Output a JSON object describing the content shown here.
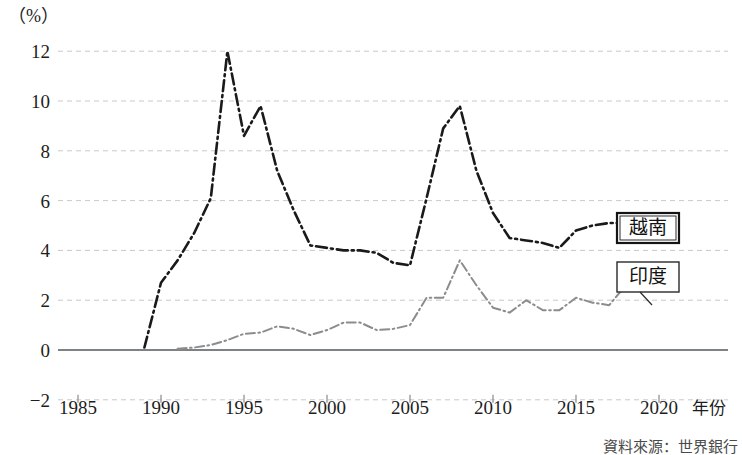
{
  "chart_data": {
    "type": "line",
    "title": "",
    "unit_label": "（%）",
    "xlabel": "年份",
    "ylabel": "",
    "xlim": [
      1983,
      2021
    ],
    "ylim": [
      -2,
      13
    ],
    "grid": true,
    "x_ticks": [
      "1985",
      "1990",
      "1995",
      "2000",
      "2005",
      "2010",
      "2015",
      "2020"
    ],
    "x_tick_values": [
      1985,
      1990,
      1995,
      2000,
      2005,
      2010,
      2015,
      2020
    ],
    "y_ticks": [
      "12",
      "10",
      "8",
      "6",
      "4",
      "2",
      "0",
      "-2"
    ],
    "y_tick_values": [
      12,
      10,
      8,
      6,
      4,
      2,
      0,
      -2
    ],
    "legend_position": "right-inside",
    "series": [
      {
        "name": "越南",
        "color": "#1a1a1a",
        "style": "dash-dot",
        "width": 2.6,
        "x": [
          1989,
          1990,
          1991,
          1992,
          1993,
          1994,
          1995,
          1996,
          1997,
          1998,
          1999,
          2000,
          2001,
          2002,
          2003,
          2004,
          2005,
          2006,
          2007,
          2008,
          2009,
          2010,
          2011,
          2012,
          2013,
          2014,
          2015,
          2016,
          2017,
          2018
        ],
        "values": [
          0.1,
          2.7,
          3.6,
          4.7,
          6.1,
          12.0,
          8.6,
          9.8,
          7.2,
          5.6,
          4.2,
          4.1,
          4.0,
          4.0,
          3.9,
          3.5,
          3.4,
          6.1,
          8.9,
          9.8,
          7.2,
          5.5,
          4.5,
          4.4,
          4.3,
          4.1,
          4.8,
          5.0,
          5.1,
          5.1
        ]
      },
      {
        "name": "印度",
        "color": "#8c8c8c",
        "style": "dash-dot",
        "width": 2.0,
        "x": [
          1991,
          1992,
          1993,
          1994,
          1995,
          1996,
          1997,
          1998,
          1999,
          2000,
          2001,
          2002,
          2003,
          2004,
          2005,
          2006,
          2007,
          2008,
          2009,
          2010,
          2011,
          2012,
          2013,
          2014,
          2015,
          2016,
          2017,
          2018
        ],
        "values": [
          0.05,
          0.1,
          0.2,
          0.4,
          0.65,
          0.7,
          0.95,
          0.85,
          0.6,
          0.8,
          1.1,
          1.1,
          0.8,
          0.85,
          1.0,
          2.1,
          2.1,
          3.6,
          2.6,
          1.7,
          1.5,
          2.0,
          1.6,
          1.6,
          2.1,
          1.9,
          1.8,
          2.6
        ]
      }
    ],
    "annotations": [
      {
        "name": "vietnam-legend-box",
        "text": "越南"
      },
      {
        "name": "india-legend-box",
        "text": "印度"
      }
    ],
    "source_note": "資料來源：世界銀行"
  },
  "legend": {
    "vietnam": "越南",
    "india": "印度"
  },
  "axes": {
    "unit": "（%）",
    "x_title": "年份"
  },
  "footer": {
    "source": "資料來源：世界銀行"
  }
}
